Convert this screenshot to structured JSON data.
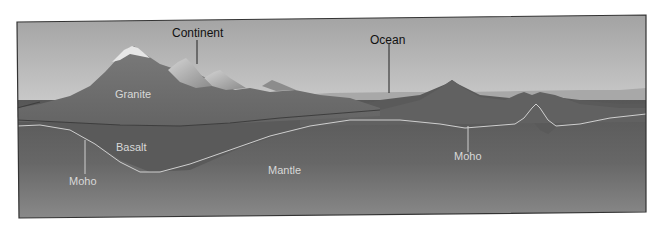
{
  "diagram": {
    "type": "geologic-cross-section",
    "labels": {
      "continent": "Continent",
      "ocean": "Ocean",
      "granite": "Granite",
      "basalt": "Basalt",
      "mantle": "Mantle",
      "moho_left": "Moho",
      "moho_right": "Moho"
    },
    "colors": {
      "sky_top": "#9a9a9a",
      "sky_mid": "#d6d6d6",
      "water": "#a9a9a9",
      "granite": "#6e6e6e",
      "mountain_highlight": "#bdbdbd",
      "basalt": "#5c5c5c",
      "mantle_top": "#585858",
      "mantle_bottom": "#8a8a8a",
      "moho_line": "#cfcfcf",
      "frame": "#333333"
    }
  }
}
